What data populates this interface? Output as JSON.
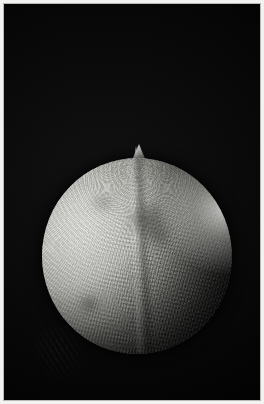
{
  "image": {
    "domain": "Natural-Image",
    "title": "Grayscale photograph of a spherical specimen",
    "subject": "textured sphere with conical apex",
    "background_color": "#030303",
    "frame_color": "#f2f2f0",
    "caption": "",
    "description": "Monochrome close-up photograph of a roughly spherical, light-grey specimen with a small pointed conical apex at the top. The surface is covered with fine radial ribbing and a scaly pitted texture that becomes strongly shadowed toward the lower-right. The object is lit from the upper left and is set against a plain black background inside a thin white border."
  },
  "frame": {
    "border_width_px": 4,
    "border_color": "#f2f2f0",
    "hairline_color": "#b9b9b5"
  },
  "plate": {
    "width_px": 256,
    "height_px": 396,
    "background_color": "#030303"
  },
  "specimen": {
    "name": "spherical-specimen",
    "center_x_px": 131,
    "center_y_px": 248,
    "diameter_px": 190,
    "apex": {
      "name": "conical-apex",
      "x_px": 131,
      "y_px": 146,
      "height_px": 30,
      "width_px": 26
    },
    "lighting": {
      "direction": "upper-left",
      "highlight_color": "#e9e9e5",
      "midtone_color": "#a9a9a3",
      "shadow_color": "#1d1d1b",
      "rim_light_color": "#f0f0ec"
    },
    "texture": {
      "primary": "radial-ribbing",
      "secondary": "concentric-growth-lines",
      "tertiary": "scaly-pitting",
      "seam": "vertical-median-ridge"
    },
    "blotches": [
      {
        "name": "blotch-upper-centre",
        "x_pct": 44,
        "y_pct": 22
      },
      {
        "name": "blotch-mid-centre",
        "x_pct": 52,
        "y_pct": 33
      },
      {
        "name": "blotch-lower-left",
        "x_pct": 18,
        "y_pct": 70
      },
      {
        "name": "blotch-upper-left",
        "x_pct": 24,
        "y_pct": 18
      }
    ]
  },
  "debris": {
    "name": "faint-lower-left-texture",
    "x_px": 30,
    "y_px": 322,
    "opacity": 0.5
  }
}
